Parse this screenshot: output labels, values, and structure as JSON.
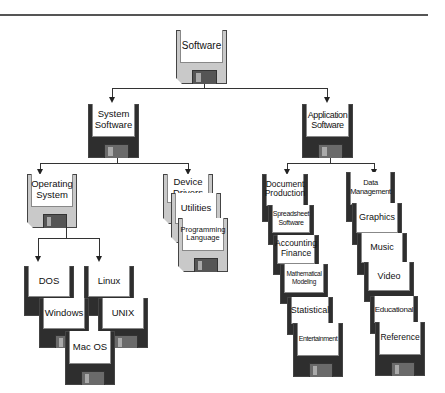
{
  "diagram": {
    "title": "Software",
    "root": {
      "label": "Software"
    },
    "categories": [
      {
        "label": "System Software",
        "children": [
          {
            "label": "Operating System",
            "children": [
              "DOS",
              "Linux",
              "Windows",
              "UNIX",
              "Mac OS"
            ]
          },
          {
            "label": "Device Drivers"
          },
          {
            "label": "Utilities"
          },
          {
            "label": "Programming Language"
          }
        ]
      },
      {
        "label": "Application Software",
        "columns": [
          [
            "Document Production",
            "Spreadsheet Software",
            "Accounting Finance",
            "Mathematical Modeling",
            "Statistical",
            "Entertainment"
          ],
          [
            "Data Management",
            "Graphics",
            "Music",
            "Video",
            "Educational",
            "Reference"
          ]
        ]
      }
    ]
  },
  "nodes": {
    "software": "Software",
    "system_software": "System Software",
    "application_software": "Application Software",
    "operating_system": "Operating System",
    "device_drivers": "Device Drivers",
    "utilities": "Utilities",
    "programming_language": "Programming Language",
    "dos": "DOS",
    "linux": "Linux",
    "windows": "Windows",
    "unix": "UNIX",
    "mac_os": "Mac OS",
    "document_production": "Document Production",
    "spreadsheet_software": "Spreadsheet Software",
    "accounting_finance": "Accounting Finance",
    "mathematical_modeling": "Mathematical Modeling",
    "statistical": "Statistical",
    "entertainment": "Entertainment",
    "data_management": "Data Management",
    "graphics": "Graphics",
    "music": "Music",
    "video": "Video",
    "educational": "Educational",
    "reference": "Reference"
  },
  "colors": {
    "light_disk": "#c9c9c9",
    "dark_disk": "#2e2e2e",
    "label": "#ffffff",
    "line": "#333333"
  }
}
